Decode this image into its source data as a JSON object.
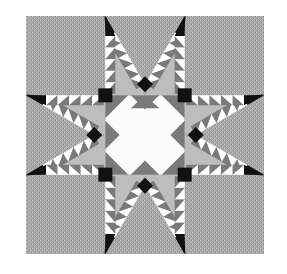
{
  "image": {
    "subject": "quilt-block-feathered-eight-point-star",
    "width": 287,
    "height": 274
  },
  "block": {
    "x": 26,
    "y": 16,
    "size": 238,
    "grid": 3,
    "sawtooth_per_edge": 5
  },
  "colors": {
    "page_background": "#ffffff",
    "field_gray": "#a8a8a8",
    "mid_gray": "#7a7a7a",
    "light_gray": "#bdbdbd",
    "black": "#111111",
    "white": "#ffffff",
    "center_white": "#fbfbfb"
  }
}
